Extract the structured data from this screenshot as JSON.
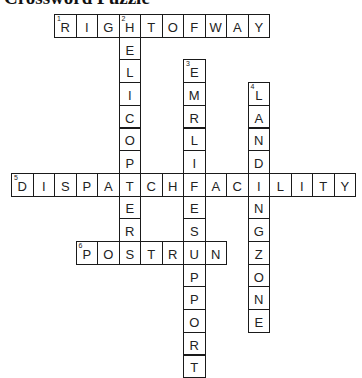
{
  "title": "Crossword Puzzle",
  "grid": {
    "origin_x": 11,
    "origin_y": 14,
    "cell_w": 21.5,
    "cell_h": 22.7
  },
  "words": [
    {
      "number": "1",
      "direction": "across",
      "answer": "RIGHTOFWAY",
      "row": 0,
      "col": 2
    },
    {
      "number": "2",
      "direction": "down",
      "answer": "HELICOPTER",
      "row": 0,
      "col": 5
    },
    {
      "number": "3",
      "direction": "down",
      "answer": "EMRLIFESUPPORT",
      "row": 2,
      "col": 8
    },
    {
      "number": "4",
      "direction": "down",
      "answer": "LANDINGZONE",
      "row": 3,
      "col": 11
    },
    {
      "number": "5",
      "direction": "across",
      "answer": "DISPATCHFACILITY",
      "row": 7,
      "col": 0
    },
    {
      "number": "6",
      "direction": "across",
      "answer": "POSTRUN",
      "row": 10,
      "col": 3
    }
  ]
}
